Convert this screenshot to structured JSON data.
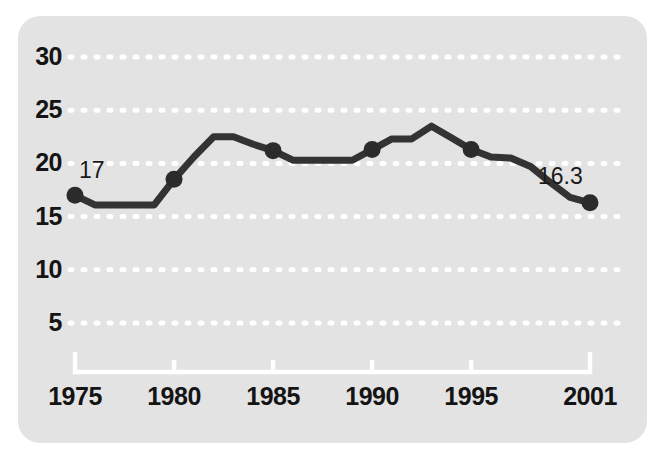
{
  "chart_data": {
    "type": "line",
    "title": "",
    "subtitle": "",
    "xlabel": "",
    "ylabel": "",
    "xlim": [
      1975,
      2001
    ],
    "ylim": [
      0,
      32
    ],
    "grid": true,
    "grid_style": "dotted-white-horizontal",
    "legend": "none",
    "series": [
      {
        "name": "value",
        "x": [
          1975,
          1976,
          1977,
          1978,
          1979,
          1980,
          1981,
          1982,
          1983,
          1984,
          1985,
          1986,
          1987,
          1988,
          1989,
          1990,
          1991,
          1992,
          1993,
          1994,
          1995,
          1996,
          1997,
          1998,
          1999,
          2000,
          2001
        ],
        "values": [
          17.0,
          16.1,
          16.1,
          16.1,
          16.1,
          18.5,
          20.6,
          22.5,
          22.5,
          21.8,
          21.2,
          20.3,
          20.3,
          20.3,
          20.3,
          21.3,
          22.3,
          22.3,
          23.5,
          22.4,
          21.3,
          20.6,
          20.5,
          19.7,
          18.2,
          16.8,
          16.3
        ]
      }
    ],
    "markers_at_x": [
      1975,
      1980,
      1985,
      1990,
      1995,
      2001
    ],
    "x_ticks": [
      "1975",
      "1980",
      "1985",
      "1990",
      "1995",
      "2001"
    ],
    "x_tick_values": [
      1975,
      1980,
      1985,
      1990,
      1995,
      2001
    ],
    "y_ticks": [
      "30",
      "25",
      "20",
      "15",
      "10",
      "5"
    ],
    "y_tick_values": [
      30,
      25,
      20,
      15,
      10,
      5
    ],
    "point_labels": [
      {
        "text": "17",
        "x": 1975,
        "y": 17.0
      },
      {
        "text": "16.3",
        "x": 2001,
        "y": 16.3
      }
    ],
    "colors": {
      "panel_background": "#e3e3e3",
      "line": "#333333",
      "marker": "#2b2b2b",
      "gridline": "#ffffff",
      "axis": "#ffffff",
      "tick_text": "#141414"
    }
  }
}
